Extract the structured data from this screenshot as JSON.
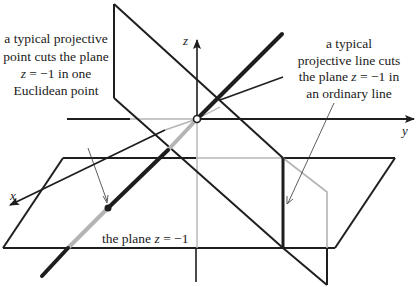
{
  "diagram": {
    "colors": {
      "ink": "#1e1e1e",
      "gray": "#b4b4b4",
      "background": "#ffffff"
    },
    "axes": {
      "x_label": "x",
      "y_label": "y",
      "z_label": "z"
    },
    "labels": {
      "point_annotation": {
        "line1": "a typical projective",
        "line2": "point cuts the plane",
        "line3_var": "z",
        "line3_rest": " = −1 in one",
        "line4": "Euclidean point"
      },
      "line_annotation": {
        "line1": "a typical",
        "line2": "projective line cuts",
        "line3_pre": "the plane ",
        "line3_var": "z",
        "line3_rest": " = −1 in",
        "line4": "an ordinary line"
      },
      "plane_label": {
        "pre": "the plane ",
        "var": "z",
        "rest": " = −1"
      }
    },
    "points": {
      "origin": {
        "x": 197,
        "y": 119,
        "style": "open-circle"
      },
      "euclidean_point": {
        "x": 108,
        "y": 208,
        "style": "filled-dot"
      }
    }
  }
}
